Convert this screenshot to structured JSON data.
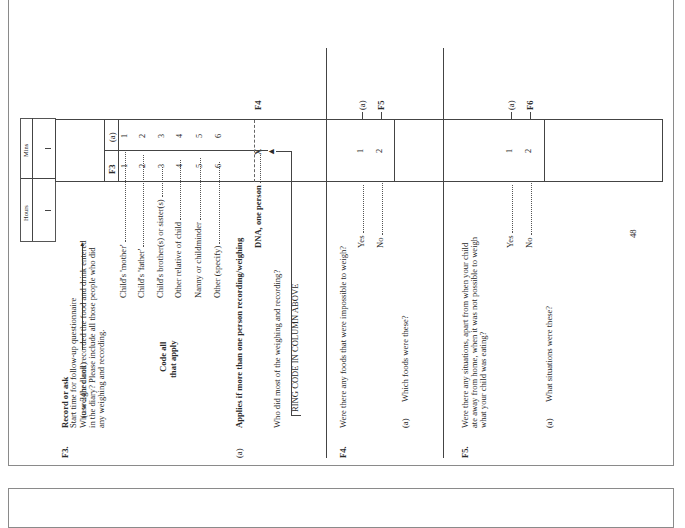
{
  "page": {
    "number": "48",
    "start_time": {
      "label_line1": "Start time for follow-up questionnaire",
      "label_line2": "(use 24hr clock)",
      "hours_label": "Hours",
      "mins_label": "Mins"
    },
    "f3": {
      "id": "F3.",
      "instruction": "Record or ask",
      "question_line1": "Who weighed and recorded the food and drink entered",
      "question_line2": "in the diary?  Please include all those people who did",
      "question_line3": "any weighing and recording.",
      "code_note_line1": "Code all",
      "code_note_line2": "that apply",
      "col_headers": [
        "F3",
        "(a)"
      ],
      "options": [
        {
          "label": "Child's 'mother'",
          "code_f3": "1",
          "code_a": "1"
        },
        {
          "label": "Child's 'father'",
          "code_f3": "2",
          "code_a": "2"
        },
        {
          "label": "Child's brother(s) or sister(s)",
          "code_f3": "3",
          "code_a": "3"
        },
        {
          "label": "Other relative of child",
          "code_f3": "4",
          "code_a": "4"
        },
        {
          "label": "Nanny or childminder",
          "code_f3": "5",
          "code_a": "5"
        },
        {
          "label": "Other (specify)",
          "code_f3": "6",
          "code_a": "6"
        }
      ],
      "sub_a": {
        "label": "(a)",
        "applies": "Applies if more than one person recording/weighing",
        "dna_label": "DNA, one person",
        "dna_code": "X",
        "route": "F4",
        "question": "Who did most of the weighing and recording?",
        "ring_note": "RING CODE IN COLUMN ABOVE"
      }
    },
    "f4": {
      "id": "F4.",
      "question": "Were there any foods that were impossible to weigh?",
      "options": [
        {
          "label": "Yes",
          "code": "1",
          "route": "(a)"
        },
        {
          "label": "No",
          "code": "2",
          "route": "F5"
        }
      ],
      "sub_a": {
        "label": "(a)",
        "question": "Which foods were these?"
      }
    },
    "f5": {
      "id": "F5.",
      "question_line1": "Were there any situations, apart from when your child",
      "question_line2": "ate away from home, when it was not possible to weigh",
      "question_line3": "what your child was eating?",
      "options": [
        {
          "label": "Yes",
          "code": "1",
          "route": "(a)"
        },
        {
          "label": "No",
          "code": "2",
          "route": "F6"
        }
      ],
      "sub_a": {
        "label": "(a)",
        "question": "What situations were these?"
      }
    }
  }
}
